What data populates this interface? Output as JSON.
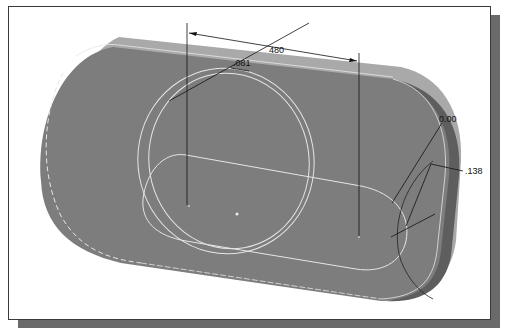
{
  "viewport": {
    "background": "#ffffff",
    "part_face_color": "#7d7d7d",
    "part_top_color": "#a9a9a9",
    "part_side_color": "#6a6a6a",
    "edge_color": "#e6e6e6",
    "dimension_color": "#111111"
  },
  "dimensions": {
    "slot_length": "480",
    "circle_diameter": ".081",
    "angle": "0.00",
    "offset": ".138"
  }
}
